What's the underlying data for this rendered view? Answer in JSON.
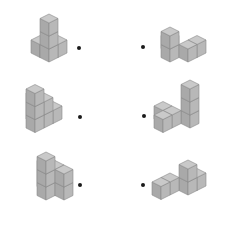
{
  "colors": {
    "background": "#ffffff",
    "top_face": "#c9c9c9",
    "left_face": "#a9a9a9",
    "right_face": "#b8b8b8",
    "edge": "#8a8a8a",
    "dot": "#1a1a1a"
  },
  "cube_geometry": {
    "half_width": 9,
    "half_height": 4.5,
    "vertical": 13
  },
  "figures": [
    {
      "id": "fig-left-1",
      "origin": [
        49,
        62
      ],
      "dot": [
        79,
        48
      ],
      "cubes": [
        [
          0,
          0,
          0
        ],
        [
          0,
          0,
          1
        ],
        [
          0,
          0,
          2
        ],
        [
          0,
          1,
          0
        ],
        [
          1,
          0,
          0
        ]
      ]
    },
    {
      "id": "fig-right-1",
      "origin": [
        170,
        62
      ],
      "dot": [
        143,
        47
      ],
      "cubes": [
        [
          0,
          0,
          0
        ],
        [
          0,
          0,
          1
        ],
        [
          1,
          -1,
          0
        ],
        [
          2,
          -1,
          0
        ],
        [
          1,
          1,
          0
        ]
      ]
    },
    {
      "id": "fig-left-2",
      "origin": [
        44,
        128
      ],
      "dot": [
        80,
        117
      ],
      "cubes": [
        [
          0,
          0,
          0
        ],
        [
          0,
          0,
          1
        ],
        [
          0,
          1,
          0
        ],
        [
          0,
          1,
          1
        ],
        [
          1,
          0,
          0
        ],
        [
          -1,
          0,
          0
        ],
        [
          -1,
          0,
          1
        ],
        [
          -1,
          0,
          2
        ]
      ]
    },
    {
      "id": "fig-right-2",
      "origin": [
        190,
        128
      ],
      "dot": [
        144,
        116
      ],
      "cubes": [
        [
          0,
          0,
          0
        ],
        [
          0,
          0,
          1
        ],
        [
          0,
          0,
          2
        ],
        [
          -1,
          1,
          0
        ],
        [
          -2,
          1,
          0
        ],
        [
          -1,
          2,
          0
        ]
      ]
    },
    {
      "id": "fig-left-3",
      "origin": [
        46,
        200
      ],
      "dot": [
        80,
        185
      ],
      "cubes": [
        [
          0,
          0,
          0
        ],
        [
          0,
          0,
          1
        ],
        [
          0,
          0,
          2
        ],
        [
          1,
          0,
          0
        ],
        [
          1,
          0,
          1
        ],
        [
          1,
          -1,
          0
        ],
        [
          1,
          -1,
          1
        ],
        [
          1,
          1,
          0
        ],
        [
          1,
          1,
          1
        ]
      ]
    },
    {
      "id": "fig-right-3",
      "origin": [
        188,
        195
      ],
      "dot": [
        143,
        185
      ],
      "cubes": [
        [
          0,
          0,
          0
        ],
        [
          0,
          0,
          1
        ],
        [
          1,
          0,
          0
        ],
        [
          -1,
          1,
          0
        ],
        [
          -2,
          1,
          0
        ]
      ]
    }
  ]
}
